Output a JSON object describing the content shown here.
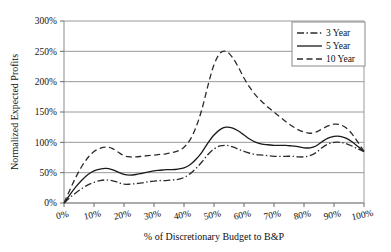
{
  "chart_data": {
    "type": "line",
    "title": "",
    "xlabel": "% of Discretionary Budget to B&P",
    "ylabel": "Normalized Expected Profits",
    "xlim": [
      0,
      100
    ],
    "ylim": [
      0,
      300
    ],
    "grid": "horizontal",
    "legend_position": "top-right",
    "x_tick_labels": [
      "0%",
      "10%",
      "20%",
      "30%",
      "40%",
      "50%",
      "60%",
      "70%",
      "80%",
      "90%",
      "100%"
    ],
    "x_ticks": [
      0,
      10,
      20,
      30,
      40,
      50,
      60,
      70,
      80,
      90,
      100
    ],
    "y_tick_labels": [
      "0%",
      "50%",
      "100%",
      "150%",
      "200%",
      "250%",
      "300%"
    ],
    "y_ticks": [
      0,
      50,
      100,
      150,
      200,
      250,
      300
    ],
    "x": [
      0,
      2,
      4,
      6,
      8,
      10,
      12,
      14,
      16,
      18,
      20,
      22,
      24,
      26,
      28,
      30,
      32,
      34,
      36,
      38,
      40,
      42,
      44,
      46,
      48,
      50,
      52,
      54,
      56,
      58,
      60,
      62,
      64,
      66,
      68,
      70,
      72,
      74,
      76,
      78,
      80,
      82,
      84,
      86,
      88,
      90,
      92,
      94,
      96,
      98,
      100
    ],
    "series": [
      {
        "name": "3 Year",
        "style": "dash-dot",
        "color": "#2b2b2b",
        "values": [
          0,
          9,
          17,
          24,
          30,
          34,
          37,
          38,
          37,
          34,
          31,
          31,
          32,
          33,
          35,
          36,
          37,
          37,
          38,
          39,
          42,
          48,
          57,
          68,
          80,
          89,
          94,
          95,
          93,
          89,
          85,
          82,
          80,
          79,
          78,
          77,
          77,
          77,
          77,
          76,
          76,
          78,
          83,
          91,
          97,
          100,
          100,
          98,
          94,
          89,
          85
        ]
      },
      {
        "name": "5 Year",
        "style": "solid",
        "color": "#1a1a1a",
        "values": [
          0,
          14,
          27,
          38,
          47,
          53,
          56,
          57,
          55,
          51,
          47,
          46,
          47,
          49,
          51,
          53,
          54,
          55,
          55,
          56,
          58,
          63,
          72,
          84,
          99,
          112,
          121,
          125,
          124,
          119,
          112,
          105,
          100,
          97,
          96,
          95,
          95,
          95,
          94,
          93,
          91,
          91,
          94,
          101,
          107,
          110,
          110,
          107,
          101,
          93,
          85
        ]
      },
      {
        "name": "10 Year",
        "style": "dashed",
        "color": "#2b2b2b",
        "values": [
          0,
          22,
          43,
          61,
          75,
          85,
          90,
          92,
          90,
          84,
          78,
          76,
          76,
          77,
          78,
          79,
          80,
          81,
          83,
          86,
          92,
          104,
          125,
          155,
          194,
          228,
          247,
          250,
          241,
          225,
          206,
          190,
          177,
          167,
          158,
          150,
          142,
          134,
          127,
          121,
          117,
          115,
          117,
          122,
          127,
          130,
          129,
          124,
          114,
          100,
          85
        ]
      }
    ]
  },
  "legend": {
    "items": [
      {
        "label": "3 Year"
      },
      {
        "label": "5 Year"
      },
      {
        "label": "10 Year"
      }
    ]
  },
  "colors": {
    "gridline": "#9a9a9a",
    "axis": "#7a7a7a",
    "text": "#111111",
    "background": "#ffffff"
  }
}
